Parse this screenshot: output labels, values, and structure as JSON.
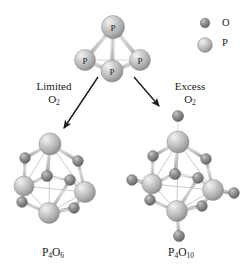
{
  "figure": {
    "background_color": "#ffffff"
  },
  "legend": {
    "items": [
      {
        "icon": "oxygen-sphere",
        "label": "O",
        "radius": 4.6,
        "color": "#7a7a7a",
        "cx": 205,
        "cy": 23
      },
      {
        "icon": "phosphorus-sphere",
        "label": "P",
        "radius": 7.2,
        "color": "#b2b2b2",
        "cx": 205,
        "cy": 45
      }
    ]
  },
  "colors": {
    "oxygen": "#7d7d7d",
    "oxygen_highlight": "#cfcfcf",
    "oxygen_shadow": "#4a4a4a",
    "phosphorus": "#b4b4b4",
    "phosphorus_highlight": "#e8e8e8",
    "phosphorus_shadow": "#7e7e7e",
    "bond": "#c6c6c6",
    "bond_edge": "#8f8f8f",
    "text": "#1a1a1a",
    "arrow": "#1a1a1a"
  },
  "reactant": {
    "name": "P4 tetrahedron",
    "atom_label": "P",
    "atoms": [
      {
        "element": "P",
        "label": "P",
        "cx": 113,
        "cy": 27,
        "r": 11.5
      },
      {
        "element": "P",
        "label": "P",
        "cx": 85,
        "cy": 60,
        "r": 10.5
      },
      {
        "element": "P",
        "label": "P",
        "cx": 140,
        "cy": 60,
        "r": 10.5
      },
      {
        "element": "P",
        "label": "P",
        "cx": 112,
        "cy": 71,
        "r": 11.0
      }
    ]
  },
  "arrows": {
    "left": {
      "name": "limited-oxygen-arrow",
      "from": {
        "x": 98,
        "y": 77
      },
      "to": {
        "x": 62,
        "y": 130
      },
      "label_line1": "Limited",
      "label_line2": "O",
      "label_sub": "2"
    },
    "right": {
      "name": "excess-oxygen-arrow",
      "from": {
        "x": 134,
        "y": 77
      },
      "to": {
        "x": 161,
        "y": 108
      },
      "label_line1": "Excess",
      "label_line2": "O",
      "label_sub": "2"
    }
  },
  "products": {
    "left": {
      "name": "p4o6-molecule",
      "formula_main1": "P",
      "formula_sub1": "4",
      "formula_main2": "O",
      "formula_sub2": "6",
      "phosphorus_atoms": [
        {
          "cx": 50,
          "cy": 144,
          "r": 11.0
        },
        {
          "cx": 24,
          "cy": 186,
          "r": 10.0
        },
        {
          "cx": 85,
          "cy": 192,
          "r": 10.5
        },
        {
          "cx": 49,
          "cy": 213,
          "r": 10.5
        }
      ],
      "bridging_oxygen_atoms": [
        {
          "cx": 25,
          "cy": 158,
          "r": 5.4
        },
        {
          "cx": 78,
          "cy": 161,
          "r": 5.4
        },
        {
          "cx": 47,
          "cy": 176,
          "r": 5.6
        },
        {
          "cx": 22,
          "cy": 202,
          "r": 5.4
        },
        {
          "cx": 70,
          "cy": 180,
          "r": 5.4
        },
        {
          "cx": 74,
          "cy": 208,
          "r": 5.4
        }
      ],
      "terminal_oxygen_atoms": []
    },
    "right": {
      "name": "p4o10-molecule",
      "formula_main1": "P",
      "formula_sub1": "4",
      "formula_main2": "O",
      "formula_sub2": "10",
      "phosphorus_atoms": [
        {
          "cx": 178,
          "cy": 142,
          "r": 11.0
        },
        {
          "cx": 152,
          "cy": 184,
          "r": 10.0
        },
        {
          "cx": 213,
          "cy": 190,
          "r": 10.5
        },
        {
          "cx": 177,
          "cy": 211,
          "r": 10.5
        }
      ],
      "bridging_oxygen_atoms": [
        {
          "cx": 153,
          "cy": 156,
          "r": 5.4
        },
        {
          "cx": 206,
          "cy": 159,
          "r": 5.4
        },
        {
          "cx": 175,
          "cy": 174,
          "r": 5.6
        },
        {
          "cx": 150,
          "cy": 200,
          "r": 5.4
        },
        {
          "cx": 198,
          "cy": 178,
          "r": 5.4
        },
        {
          "cx": 202,
          "cy": 206,
          "r": 5.4
        }
      ],
      "terminal_oxygen_atoms": [
        {
          "cx": 178,
          "cy": 116,
          "r": 5.6
        },
        {
          "cx": 132,
          "cy": 180,
          "r": 5.4
        },
        {
          "cx": 234,
          "cy": 193,
          "r": 5.4
        },
        {
          "cx": 179,
          "cy": 236,
          "r": 5.6
        }
      ]
    }
  }
}
